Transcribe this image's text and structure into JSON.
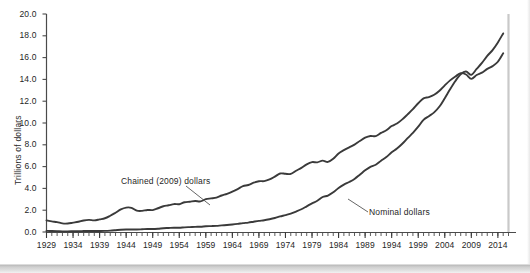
{
  "chart_data": {
    "type": "line",
    "title": "",
    "xlabel": "",
    "ylabel": "Trillions of dollars",
    "xlim": [
      1929,
      2016
    ],
    "ylim": [
      0.0,
      20.0
    ],
    "grid": false,
    "legend_position": "inline-annotations",
    "y_ticks": [
      "0.0",
      "2.0",
      "4.0",
      "6.0",
      "8.0",
      "10.0",
      "12.0",
      "14.0",
      "16.0",
      "18.0",
      "20.0"
    ],
    "y_tick_values": [
      0.0,
      2.0,
      4.0,
      6.0,
      8.0,
      10.0,
      12.0,
      14.0,
      16.0,
      18.0,
      20.0
    ],
    "x_ticks": [
      "1929",
      "1934",
      "1939",
      "1944",
      "1949",
      "1954",
      "1959",
      "1964",
      "1969",
      "1974",
      "1979",
      "1984",
      "1989",
      "1994",
      "1999",
      "2004",
      "2009",
      "2014"
    ],
    "x_tick_values": [
      1929,
      1934,
      1939,
      1944,
      1949,
      1954,
      1959,
      1964,
      1969,
      1974,
      1979,
      1984,
      1989,
      1994,
      1999,
      2004,
      2009,
      2014
    ],
    "x_minor_tick_step": 1,
    "annotations": [
      {
        "text": "Chained (2009) dollars",
        "series": "Chained (2009) dollars"
      },
      {
        "text": "Nominal dollars",
        "series": "Nominal dollars"
      }
    ],
    "series": [
      {
        "name": "Chained (2009) dollars",
        "color": "#3a3a3a",
        "x": [
          1929,
          1930,
          1931,
          1932,
          1933,
          1934,
          1935,
          1936,
          1937,
          1938,
          1939,
          1940,
          1941,
          1942,
          1943,
          1944,
          1945,
          1946,
          1947,
          1948,
          1949,
          1950,
          1951,
          1952,
          1953,
          1954,
          1955,
          1956,
          1957,
          1958,
          1959,
          1960,
          1961,
          1962,
          1963,
          1964,
          1965,
          1966,
          1967,
          1968,
          1969,
          1970,
          1971,
          1972,
          1973,
          1974,
          1975,
          1976,
          1977,
          1978,
          1979,
          1980,
          1981,
          1982,
          1983,
          1984,
          1985,
          1986,
          1987,
          1988,
          1989,
          1990,
          1991,
          1992,
          1993,
          1994,
          1995,
          1996,
          1997,
          1998,
          1999,
          2000,
          2001,
          2002,
          2003,
          2004,
          2005,
          2006,
          2007,
          2008,
          2009,
          2010,
          2011,
          2012,
          2013,
          2014,
          2015
        ],
        "y": [
          1.06,
          0.97,
          0.91,
          0.79,
          0.78,
          0.86,
          0.94,
          1.06,
          1.11,
          1.07,
          1.16,
          1.26,
          1.49,
          1.77,
          2.07,
          2.24,
          2.22,
          1.96,
          1.94,
          2.02,
          2.01,
          2.18,
          2.36,
          2.45,
          2.56,
          2.55,
          2.73,
          2.78,
          2.84,
          2.81,
          3.01,
          3.08,
          3.16,
          3.35,
          3.5,
          3.7,
          3.94,
          4.2,
          4.31,
          4.52,
          4.66,
          4.67,
          4.82,
          5.08,
          5.37,
          5.34,
          5.33,
          5.62,
          5.88,
          6.21,
          6.41,
          6.39,
          6.55,
          6.43,
          6.72,
          7.21,
          7.51,
          7.77,
          8.02,
          8.35,
          8.65,
          8.81,
          8.79,
          9.09,
          9.34,
          9.72,
          9.95,
          10.33,
          10.79,
          11.27,
          11.81,
          12.26,
          12.38,
          12.59,
          12.96,
          13.45,
          13.91,
          14.27,
          14.57,
          14.45,
          14.05,
          14.4,
          14.62,
          14.97,
          15.22,
          15.62,
          16.4
        ]
      },
      {
        "name": "Nominal dollars",
        "color": "#3a3a3a",
        "x": [
          1929,
          1930,
          1931,
          1932,
          1933,
          1934,
          1935,
          1936,
          1937,
          1938,
          1939,
          1940,
          1941,
          1942,
          1943,
          1944,
          1945,
          1946,
          1947,
          1948,
          1949,
          1950,
          1951,
          1952,
          1953,
          1954,
          1955,
          1956,
          1957,
          1958,
          1959,
          1960,
          1961,
          1962,
          1963,
          1964,
          1965,
          1966,
          1967,
          1968,
          1969,
          1970,
          1971,
          1972,
          1973,
          1974,
          1975,
          1976,
          1977,
          1978,
          1979,
          1980,
          1981,
          1982,
          1983,
          1984,
          1985,
          1986,
          1987,
          1988,
          1989,
          1990,
          1991,
          1992,
          1993,
          1994,
          1995,
          1996,
          1997,
          1998,
          1999,
          2000,
          2001,
          2002,
          2003,
          2004,
          2005,
          2006,
          2007,
          2008,
          2009,
          2010,
          2011,
          2012,
          2013,
          2014,
          2015
        ],
        "y": [
          0.105,
          0.092,
          0.077,
          0.06,
          0.057,
          0.066,
          0.074,
          0.085,
          0.093,
          0.087,
          0.093,
          0.103,
          0.129,
          0.166,
          0.203,
          0.224,
          0.228,
          0.228,
          0.25,
          0.275,
          0.273,
          0.3,
          0.347,
          0.367,
          0.389,
          0.391,
          0.426,
          0.45,
          0.474,
          0.482,
          0.522,
          0.543,
          0.563,
          0.605,
          0.639,
          0.686,
          0.744,
          0.815,
          0.862,
          0.943,
          1.02,
          1.076,
          1.168,
          1.282,
          1.429,
          1.549,
          1.689,
          1.878,
          2.086,
          2.357,
          2.632,
          2.863,
          3.211,
          3.345,
          3.638,
          4.041,
          4.347,
          4.59,
          4.87,
          5.253,
          5.658,
          5.98,
          6.174,
          6.539,
          6.879,
          7.309,
          7.664,
          8.1,
          8.609,
          9.089,
          9.661,
          10.285,
          10.622,
          10.978,
          11.511,
          12.275,
          13.094,
          13.856,
          14.478,
          14.719,
          14.419,
          14.964,
          15.518,
          16.155,
          16.692,
          17.393,
          18.22
        ]
      }
    ]
  },
  "y_axis_title": "Trillions of dollars",
  "annotation_chained": "Chained (2009) dollars",
  "annotation_nominal": "Nominal dollars"
}
